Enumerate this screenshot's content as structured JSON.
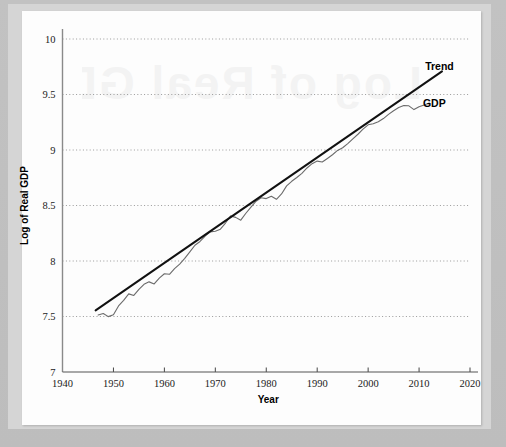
{
  "figure": {
    "background_color": "#c0c0c0",
    "card_color": "#fdfdfd",
    "watermark_text": "Log of Real GDP"
  },
  "chart_data": {
    "type": "line",
    "title": "",
    "subtitle": "",
    "xlabel": "Year",
    "ylabel": "Log of Real GDP",
    "xlim": [
      1940,
      2020
    ],
    "ylim": [
      7,
      10
    ],
    "xticks": [
      1940,
      1950,
      1960,
      1970,
      1980,
      1990,
      2000,
      2010,
      2020
    ],
    "xtick_labels": [
      "1940",
      "1950",
      "1960",
      "1970",
      "1980",
      "1990",
      "2000",
      "2010",
      "2020"
    ],
    "yticks": [
      7,
      7.5,
      8,
      8.5,
      9,
      9.5,
      10
    ],
    "ytick_labels": [
      "7",
      "7.5",
      "8",
      "8.5",
      "9",
      "9.5",
      "10"
    ],
    "grid": "horizontal-dotted",
    "legend_position": "inline-annotation",
    "annotations": [
      {
        "text": "Trend",
        "x": 2014,
        "y": 9.72
      },
      {
        "text": "GDP",
        "x": 2013,
        "y": 9.39
      }
    ],
    "series": [
      {
        "name": "GDP",
        "color": "#6b6b6b",
        "width": 1.1,
        "style": "solid",
        "x": [
          1947,
          1948,
          1949,
          1950,
          1951,
          1952,
          1953,
          1954,
          1955,
          1956,
          1957,
          1958,
          1959,
          1960,
          1961,
          1962,
          1963,
          1964,
          1965,
          1966,
          1967,
          1968,
          1969,
          1970,
          1971,
          1972,
          1973,
          1974,
          1975,
          1976,
          1977,
          1978,
          1979,
          1980,
          1981,
          1982,
          1983,
          1984,
          1985,
          1986,
          1987,
          1988,
          1989,
          1990,
          1991,
          1992,
          1993,
          1994,
          1995,
          1996,
          1997,
          1998,
          1999,
          2000,
          2001,
          2002,
          2003,
          2004,
          2005,
          2006,
          2007,
          2008,
          2009,
          2010,
          2011,
          2012
        ],
        "y": [
          7.513,
          7.527,
          7.499,
          7.516,
          7.595,
          7.645,
          7.704,
          7.69,
          7.744,
          7.79,
          7.812,
          7.793,
          7.846,
          7.885,
          7.88,
          7.932,
          7.972,
          8.023,
          8.082,
          8.142,
          8.176,
          8.224,
          8.262,
          8.268,
          8.287,
          8.342,
          8.406,
          8.393,
          8.368,
          8.43,
          8.485,
          8.539,
          8.57,
          8.562,
          8.583,
          8.556,
          8.604,
          8.677,
          8.718,
          8.752,
          8.79,
          8.838,
          8.877,
          8.9,
          8.892,
          8.924,
          8.957,
          8.996,
          9.02,
          9.058,
          9.101,
          9.142,
          9.188,
          9.227,
          9.237,
          9.255,
          9.283,
          9.321,
          9.354,
          9.383,
          9.401,
          9.398,
          9.364,
          9.389,
          9.405,
          9.424
        ]
      },
      {
        "name": "Trend",
        "color": "#111111",
        "width": 2.0,
        "style": "solid",
        "x": [
          1946.5,
          2014.5
        ],
        "y": [
          7.555,
          9.708
        ]
      }
    ]
  },
  "axes": {
    "x_axis_name": "year-axis",
    "y_axis_name": "log-real-gdp-axis"
  }
}
